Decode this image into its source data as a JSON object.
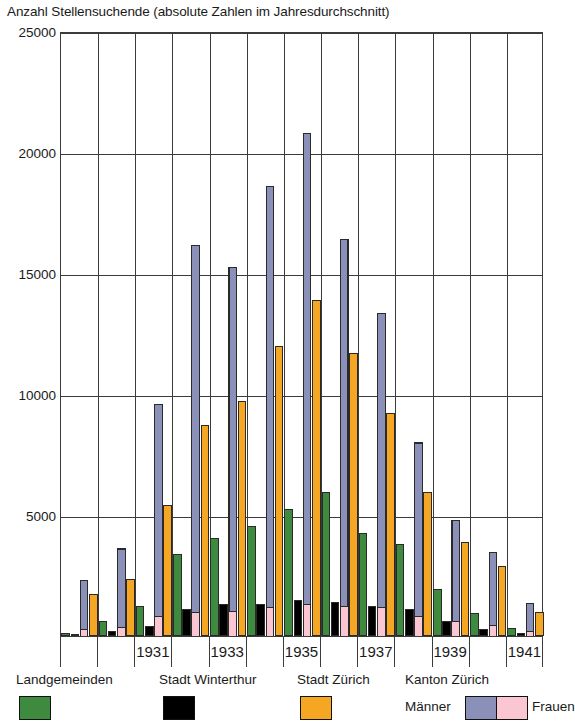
{
  "chart_data": {
    "type": "bar",
    "title": "Anzahl Stellensuchende (absolute Zahlen im Jahresdurchschnitt)",
    "xlabel": "",
    "ylabel": "",
    "ylim": [
      0,
      25000
    ],
    "grid": true,
    "stacked_series": [
      "Männer",
      "Frauen"
    ],
    "legend_position": "bottom",
    "yticks": [
      25000,
      20000,
      15000,
      10000,
      5000
    ],
    "ytick_labels": [
      "25000",
      "20000",
      "15000",
      "10000",
      "5000"
    ],
    "categories": [
      1929,
      1930,
      1931,
      1932,
      1933,
      1934,
      1935,
      1936,
      1937,
      1938,
      1939,
      1940,
      1941
    ],
    "xtick_labels": [
      "1931",
      "1933",
      "1935",
      "1937",
      "1939",
      "1941"
    ],
    "series": [
      {
        "name": "Landgemeinden",
        "color": "#3e8a3e",
        "values": [
          130,
          620,
          1250,
          3400,
          4050,
          4550,
          5250,
          5950,
          4250,
          3800,
          1950,
          950,
          330
        ]
      },
      {
        "name": "Stadt Winterthur",
        "color": "#000000",
        "values": [
          60,
          190,
          430,
          1100,
          1320,
          1330,
          1480,
          1400,
          1230,
          1100,
          620,
          290,
          120
        ]
      },
      {
        "name": "Stadt Zürich",
        "color": "#f5a623",
        "values": [
          1750,
          2350,
          5400,
          8700,
          9700,
          12000,
          13900,
          11700,
          9200,
          5950,
          3900,
          2900,
          1000
        ]
      },
      {
        "name": "Kanton Zürich Männer",
        "color": "#8a90b8",
        "values": [
          2050,
          3300,
          8800,
          15200,
          14250,
          17450,
          19500,
          15200,
          12200,
          7200,
          4200,
          3050,
          1200
        ]
      },
      {
        "name": "Kanton Zürich Frauen",
        "color": "#f9c6d2",
        "values": [
          250,
          320,
          800,
          950,
          1000,
          1150,
          1300,
          1200,
          1150,
          800,
          580,
          430,
          180
        ]
      }
    ],
    "kanton_totals": [
      2300,
      3620,
      9600,
      16150,
      15250,
      18600,
      20800,
      16400,
      13350,
      8000,
      4780,
      3480,
      1380
    ]
  },
  "legend": {
    "items": [
      {
        "label": "Landgemeinden",
        "swatch": "green"
      },
      {
        "label": "Stadt Winterthur",
        "swatch": "black"
      },
      {
        "label": "Stadt Zürich",
        "swatch": "orange"
      },
      {
        "label": "Kanton Zürich",
        "swatch": "split"
      }
    ],
    "kanton_left_label": "Männer",
    "kanton_right_label": "Frauen"
  },
  "colors": {
    "landgemeinden": "#3e8a3e",
    "winterthur": "#000000",
    "stadt_zuerich": "#f5a623",
    "maenner": "#8a90b8",
    "frauen": "#f9c6d2",
    "axis": "#3b3b3b",
    "background": "#ffffff"
  }
}
